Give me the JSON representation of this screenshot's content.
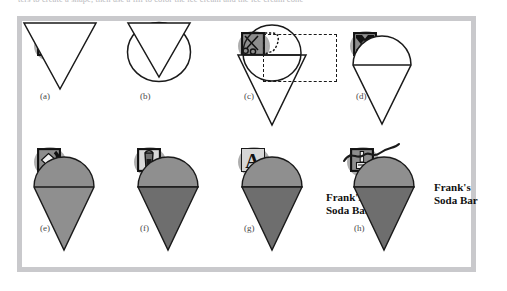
{
  "page": {
    "cut_off_caption": "ters to create a shape, then use a fill to color the ice cream and the ice cream cone",
    "frame_border_color": "#c9c9cc",
    "canvas_color": "#ffffff"
  },
  "figure": {
    "ink_color": "#1a1a1a",
    "fill_light_gray": "#8f8f8f",
    "fill_dark_gray": "#6e6e6e",
    "icon_square_color": "#8d8d8d",
    "icon_blob_color": "#a8a8a8",
    "panels": [
      {
        "id": "a",
        "label": "(a)",
        "tool_icon": "line-tool-icon",
        "tool_icon_description": "square with diagonal line",
        "shapes": [
          "cone-triangle-outline"
        ],
        "text": null
      },
      {
        "id": "b",
        "label": "(b)",
        "tool_icon": "ellipse-tool-icon",
        "tool_icon_description": "square with filled circle",
        "shapes": [
          "circle-outline",
          "cone-triangle-outline"
        ],
        "text": null
      },
      {
        "id": "c",
        "label": "(c)",
        "tool_icon": "scissors-cut-tool-icon",
        "tool_icon_description": "scissors with dashed cut path",
        "shapes": [
          "circle-outline",
          "cone-triangle-outline",
          "dashed-selection-box"
        ],
        "text": null
      },
      {
        "id": "d",
        "label": "(d)",
        "tool_icon": "move-transform-tool-icon",
        "tool_icon_description": "four-way move arrows",
        "shapes": [
          "ice-cream-cone-outline"
        ],
        "text": null
      },
      {
        "id": "e",
        "label": "(e)",
        "tool_icon": "gradient-fill-tool-icon",
        "tool_icon_description": "diamond with swirl",
        "shapes": [
          "ice-cream-cone-filled-uniform"
        ],
        "text": null
      },
      {
        "id": "f",
        "label": "(f)",
        "tool_icon": "paint-bucket-tool-icon",
        "tool_icon_description": "tilted paint bucket pouring",
        "shapes": [
          "ice-cream-cone-filled-two-tone"
        ],
        "text": null
      },
      {
        "id": "g",
        "label": "(g)",
        "tool_icon": "text-tool-icon",
        "tool_icon_description": "letter A",
        "shapes": [
          "ice-cream-cone-filled-two-tone"
        ],
        "text": "Frank's\nSoda Bar"
      },
      {
        "id": "h",
        "label": "(h)",
        "tool_icon": "brush-pen-tool-icon",
        "tool_icon_description": "pen or brush in a box",
        "shapes": [
          "ice-cream-cone-filled-two-tone",
          "freehand-squiggle"
        ],
        "text": "Frank's\nSoda Bar"
      }
    ],
    "brand_text_line1": "Frank's",
    "brand_text_line2": "Soda Bar"
  }
}
